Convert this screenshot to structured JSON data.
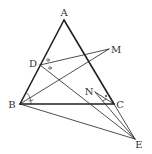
{
  "figure": {
    "type": "geometry-diagram",
    "points": {
      "A": {
        "label": "A",
        "x": 64,
        "y": 20,
        "lx": 64,
        "ly": 16
      },
      "B": {
        "label": "B",
        "x": 20,
        "y": 104,
        "lx": 12,
        "ly": 108
      },
      "C": {
        "label": "C",
        "x": 114,
        "y": 104,
        "lx": 119,
        "ly": 108
      },
      "D": {
        "label": "D",
        "x": 40,
        "y": 65,
        "lx": 33,
        "ly": 66
      },
      "M": {
        "label": "M",
        "x": 109,
        "y": 49,
        "lx": 115,
        "ly": 53
      },
      "N": {
        "label": "N",
        "x": 95,
        "y": 92,
        "lx": 90,
        "ly": 94
      },
      "E": {
        "label": "E",
        "x": 135,
        "y": 139,
        "lx": 139,
        "ly": 148
      }
    },
    "segments": [
      {
        "from": "A",
        "to": "B",
        "weight": "thick"
      },
      {
        "from": "A",
        "to": "C",
        "weight": "thick"
      },
      {
        "from": "B",
        "to": "C",
        "weight": "thick"
      },
      {
        "from": "D",
        "to": "M",
        "weight": "thin"
      },
      {
        "from": "B",
        "to": "M",
        "weight": "thin"
      },
      {
        "from": "D",
        "to": "E",
        "weight": "thin"
      },
      {
        "from": "B",
        "to": "E",
        "weight": "thin"
      },
      {
        "from": "C",
        "to": "E",
        "weight": "thin"
      },
      {
        "from": "N",
        "to": "E",
        "weight": "thin"
      },
      {
        "from": "N",
        "to": "C",
        "weight": "thin"
      }
    ],
    "angle_marks": [
      {
        "vertex": "D",
        "type": "circle",
        "note": "angle MDA-side"
      },
      {
        "vertex": "D",
        "type": "circle",
        "note": "angle between DM and DE"
      },
      {
        "vertex": "B",
        "type": "arc-tick",
        "note": "angle ABM"
      },
      {
        "vertex": "B",
        "type": "arc-tick",
        "note": "angle MBC"
      },
      {
        "vertex": "C",
        "type": "dot",
        "note": "angle at C/N"
      }
    ],
    "colors": {
      "stroke": "#222222",
      "label": "#333333"
    }
  }
}
